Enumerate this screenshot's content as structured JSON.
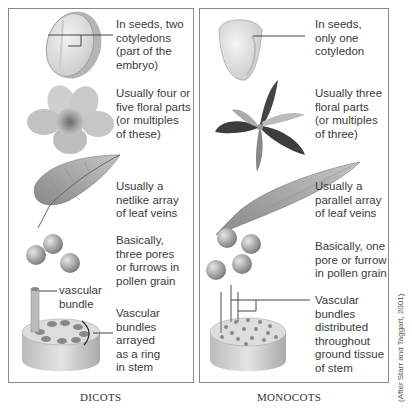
{
  "dicots": {
    "caption": "DICOTS",
    "seed_label": "In seeds, two\ncotyledons\n(part of the\nembryo)",
    "flower_label": "Usually four or\nfive floral parts\n(or multiples\nof these)",
    "leaf_label": "Usually a\nnetlike array\nof leaf veins",
    "pollen_label": "Basically,\nthree pores\nor furrows in\npollen grain",
    "bundle_label": "vascular\nbundle",
    "stem_label": "Vascular\nbundles\narrayed\nas a ring\nin stem"
  },
  "monocots": {
    "caption": "MONOCOTS",
    "seed_label": "In seeds,\nonly one\ncotyledon",
    "flower_label": "Usually three\nfloral parts\n(or multiples\nof three)",
    "leaf_label": "Usually a\nparallel array\nof leaf veins",
    "pollen_label": "Basically, one\npore or furrow\nin pollen grain",
    "stem_label": "Vascular\nbundles\ndistributed\nthroughout\nground tissue\nof stem"
  },
  "credit": "(After Starr and Taggart, 2001)",
  "colors": {
    "border": "#8a8a8a",
    "text": "#3a3a3a",
    "illustration_light": "#e6e6e6",
    "illustration_dark": "#555555"
  }
}
